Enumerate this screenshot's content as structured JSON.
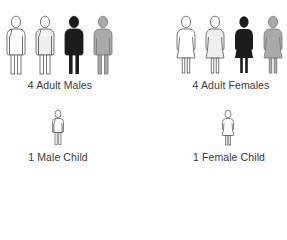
{
  "groups": [
    {
      "id": "adult-males",
      "label": "4 Adult Males",
      "count": 4,
      "type": "adult-male",
      "fills": [
        "#ffffff",
        "#eeeeee",
        "#1c1c1c",
        "#a9a9a9"
      ]
    },
    {
      "id": "adult-females",
      "label": "4 Adult Females",
      "count": 4,
      "type": "adult-female",
      "fills": [
        "#ffffff",
        "#eeeeee",
        "#1c1c1c",
        "#a9a9a9"
      ]
    },
    {
      "id": "male-child",
      "label": "1 Male Child",
      "count": 1,
      "type": "child-male",
      "fills": [
        "#ffffff"
      ]
    },
    {
      "id": "female-child",
      "label": "1 Female Child",
      "count": 1,
      "type": "child-female",
      "fills": [
        "#ffffff"
      ]
    }
  ],
  "colors": {
    "outline": "#555555",
    "label_text": "#3a3a3a",
    "background": "#ffffff"
  }
}
